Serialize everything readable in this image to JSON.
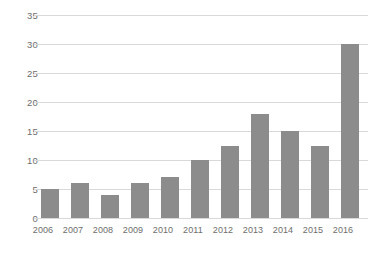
{
  "chart_data": {
    "type": "bar",
    "title": "",
    "subtitle": "",
    "xlabel": "",
    "ylabel": "",
    "categories": [
      "2006",
      "2007",
      "2008",
      "2009",
      "2010",
      "2011",
      "2012",
      "2013",
      "2014",
      "2015",
      "2016"
    ],
    "values": [
      5,
      6,
      4,
      6,
      7,
      10,
      12.5,
      18,
      15,
      12.5,
      30
    ],
    "series": [
      {
        "name": "",
        "values": [
          5,
          6,
          4,
          6,
          7,
          10,
          12.5,
          18,
          15,
          12.5,
          30
        ]
      }
    ],
    "ylim": [
      0,
      35
    ],
    "ytick_values": [
      0,
      5,
      10,
      15,
      20,
      25,
      30,
      35
    ],
    "ytick_labels": [
      "0",
      "5",
      "10",
      "15",
      "20",
      "25",
      "30",
      "35"
    ],
    "xtick_labels": [
      "2006",
      "2007",
      "2008",
      "2009",
      "2010",
      "2011",
      "2012",
      "2013",
      "2014",
      "2015",
      "2016"
    ],
    "grid": "horizontal",
    "legend": "none",
    "annotations": [],
    "bar_color": "#8c8c8c",
    "gridline_color": "#d9d9d9",
    "tick_label_color": "#6e6e6e",
    "background_color": "#ffffff"
  }
}
